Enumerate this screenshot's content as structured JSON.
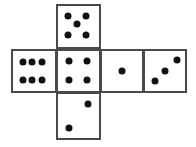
{
  "figure": {
    "name": "cube-net-dice",
    "canvas": {
      "width": 196,
      "height": 147
    },
    "colors": {
      "background": "#ffffff",
      "face_fill": "#ffffff",
      "border": "#4a4a4a",
      "pip": "#111111"
    },
    "style": {
      "border_width_px": 2,
      "pip_diameter_px": 7
    }
  },
  "faces": [
    {
      "id": "face-top",
      "name": "top-face",
      "value": 5,
      "grid_col": 2,
      "grid_row": 1,
      "rect": {
        "x": 56,
        "y": 4,
        "w": 45,
        "h": 45
      },
      "pips": [
        {
          "cx": 24,
          "cy": 24
        },
        {
          "cx": 68,
          "cy": 24
        },
        {
          "cx": 46,
          "cy": 45
        },
        {
          "cx": 24,
          "cy": 70
        },
        {
          "cx": 68,
          "cy": 70
        }
      ]
    },
    {
      "id": "face-left",
      "name": "left-face",
      "value": 6,
      "grid_col": 1,
      "grid_row": 2,
      "rect": {
        "x": 11,
        "y": 49,
        "w": 46,
        "h": 44
      },
      "pips": [
        {
          "cx": 24,
          "cy": 28
        },
        {
          "cx": 46,
          "cy": 28
        },
        {
          "cx": 68,
          "cy": 28
        },
        {
          "cx": 24,
          "cy": 72
        },
        {
          "cx": 46,
          "cy": 72
        },
        {
          "cx": 68,
          "cy": 72
        }
      ]
    },
    {
      "id": "face-center",
      "name": "center-face",
      "value": 4,
      "grid_col": 2,
      "grid_row": 2,
      "rect": {
        "x": 56,
        "y": 49,
        "w": 45,
        "h": 44
      },
      "pips": [
        {
          "cx": 26,
          "cy": 26
        },
        {
          "cx": 70,
          "cy": 26
        },
        {
          "cx": 26,
          "cy": 72
        },
        {
          "cx": 70,
          "cy": 72
        }
      ]
    },
    {
      "id": "face-right-inner",
      "name": "right-inner-face",
      "value": 1,
      "grid_col": 3,
      "grid_row": 2,
      "rect": {
        "x": 100,
        "y": 49,
        "w": 44,
        "h": 44
      },
      "pips": [
        {
          "cx": 50,
          "cy": 50
        }
      ]
    },
    {
      "id": "face-right-outer",
      "name": "right-outer-face",
      "value": 3,
      "grid_col": 4,
      "grid_row": 2,
      "rect": {
        "x": 143,
        "y": 49,
        "w": 44,
        "h": 44
      },
      "pips": [
        {
          "cx": 25,
          "cy": 76
        },
        {
          "cx": 50,
          "cy": 50
        },
        {
          "cx": 79,
          "cy": 22
        }
      ]
    },
    {
      "id": "face-bottom",
      "name": "bottom-face",
      "value": 2,
      "grid_col": 2,
      "grid_row": 3,
      "rect": {
        "x": 56,
        "y": 92,
        "w": 45,
        "h": 48
      },
      "pips": [
        {
          "cx": 26,
          "cy": 78
        },
        {
          "cx": 72,
          "cy": 22
        }
      ]
    }
  ]
}
